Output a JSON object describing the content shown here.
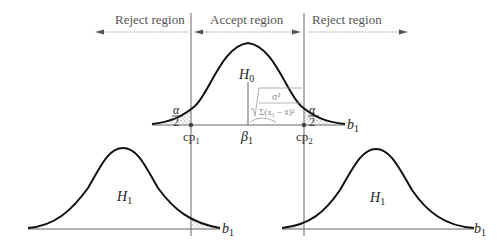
{
  "regions": {
    "left_reject": "Reject region",
    "accept": "Accept region",
    "right_reject": "Reject region"
  },
  "top_plot": {
    "hypothesis_label": "H",
    "hypothesis_sub": "0",
    "alpha_num": "α",
    "alpha_den": "2",
    "axis_label": "b",
    "axis_sub": "1",
    "cp1": "cp",
    "cp1_sub": "1",
    "cp2": "cp",
    "cp2_sub": "2",
    "beta": "β",
    "beta_sub": "1",
    "formula_num": "σ²",
    "formula_den": "Σ(x",
    "formula_den_sub": "1",
    "formula_den_rest": " − x̄)²"
  },
  "bottom_left_plot": {
    "hypothesis_label": "H",
    "hypothesis_sub": "1",
    "axis_label": "b",
    "axis_sub": "1"
  },
  "bottom_right_plot": {
    "hypothesis_label": "H",
    "hypothesis_sub": "1",
    "axis_label": "b",
    "axis_sub": "1"
  },
  "colors": {
    "curve": "#111111",
    "axis": "#666666",
    "arrow": "#555555",
    "shade": "#9a9a9a"
  }
}
